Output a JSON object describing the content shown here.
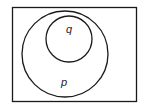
{
  "diagram": {
    "type": "euler",
    "universe": {
      "label": ""
    },
    "sets": [
      {
        "name": "p",
        "label": "p",
        "contains": [
          "q"
        ]
      },
      {
        "name": "q",
        "label": "q",
        "contains": []
      }
    ],
    "colors": {
      "stroke": "#1a1a1a",
      "background": "#ffffff"
    }
  }
}
